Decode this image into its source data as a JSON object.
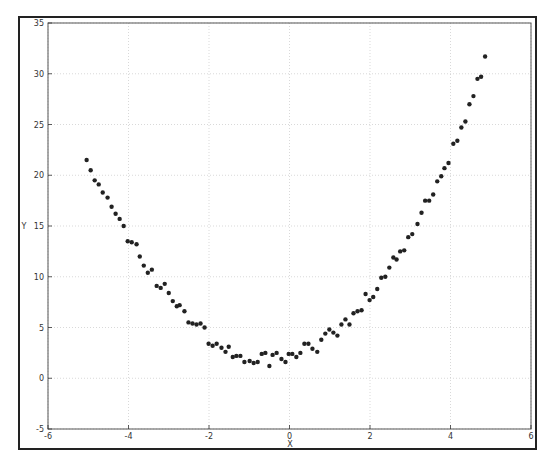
{
  "figure": {
    "xlabel": "X",
    "ylabel": "Y",
    "xticks": [
      "-6",
      "-4",
      "-2",
      "0",
      "2",
      "4",
      "6"
    ],
    "yticks": [
      "-5",
      "0",
      "5",
      "10",
      "15",
      "20",
      "25",
      "30",
      "35"
    ],
    "point_color": "#222222",
    "grid_color": "#c8c8c8"
  },
  "chart_data": {
    "type": "scatter",
    "title": "",
    "xlabel": "X",
    "ylabel": "Y",
    "xlim": [
      -6,
      6
    ],
    "ylim": [
      -5,
      35
    ],
    "grid": true,
    "legend": null,
    "x": [
      -5.04,
      -4.94,
      -4.84,
      -4.74,
      -4.64,
      -4.52,
      -4.42,
      -4.32,
      -4.22,
      -4.12,
      -4.02,
      -3.92,
      -3.8,
      -3.72,
      -3.62,
      -3.52,
      -3.42,
      -3.3,
      -3.2,
      -3.1,
      -3.0,
      -2.9,
      -2.8,
      -2.73,
      -2.61,
      -2.51,
      -2.41,
      -2.31,
      -2.21,
      -2.11,
      -2.01,
      -1.91,
      -1.81,
      -1.69,
      -1.59,
      -1.51,
      -1.41,
      -1.32,
      -1.22,
      -1.12,
      -0.99,
      -0.89,
      -0.79,
      -0.69,
      -0.6,
      -0.5,
      -0.42,
      -0.32,
      -0.2,
      -0.1,
      -0.02,
      0.07,
      0.17,
      0.27,
      0.37,
      0.47,
      0.57,
      0.69,
      0.79,
      0.89,
      0.99,
      1.09,
      1.19,
      1.29,
      1.39,
      1.49,
      1.59,
      1.69,
      1.79,
      1.89,
      1.99,
      2.08,
      2.18,
      2.28,
      2.38,
      2.48,
      2.58,
      2.66,
      2.75,
      2.85,
      2.95,
      3.05,
      3.18,
      3.28,
      3.37,
      3.47,
      3.57,
      3.67,
      3.77,
      3.85,
      3.95,
      4.07,
      4.17,
      4.27,
      4.37,
      4.47,
      4.57,
      4.67,
      4.76,
      4.86
    ],
    "y": [
      21.5,
      20.5,
      19.5,
      19.1,
      18.3,
      17.8,
      16.9,
      16.2,
      15.7,
      15.0,
      13.5,
      13.4,
      13.2,
      12.0,
      11.1,
      10.4,
      10.7,
      9.1,
      8.9,
      9.3,
      8.4,
      7.6,
      7.1,
      7.2,
      6.6,
      5.5,
      5.4,
      5.3,
      5.4,
      5.0,
      3.4,
      3.2,
      3.4,
      3.0,
      2.6,
      3.1,
      2.1,
      2.2,
      2.2,
      1.6,
      1.7,
      1.5,
      1.6,
      2.4,
      2.5,
      1.2,
      2.3,
      2.5,
      1.9,
      1.6,
      2.4,
      2.4,
      2.1,
      2.5,
      3.4,
      3.4,
      2.9,
      2.6,
      3.8,
      4.4,
      4.8,
      4.5,
      4.2,
      5.3,
      5.8,
      5.3,
      6.4,
      6.6,
      6.7,
      8.3,
      7.7,
      8.0,
      8.8,
      9.9,
      10.0,
      10.9,
      11.9,
      11.7,
      12.5,
      12.6,
      13.9,
      14.2,
      15.2,
      16.3,
      17.5,
      17.5,
      18.1,
      19.4,
      19.9,
      20.7,
      21.2,
      23.1,
      23.4,
      24.7,
      25.3,
      27.0,
      27.8,
      29.5,
      29.7,
      31.7
    ]
  }
}
